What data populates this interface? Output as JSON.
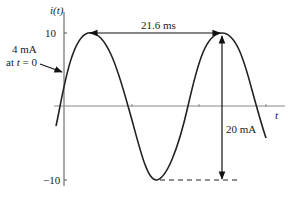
{
  "diagram": {
    "type": "sinusoid-waveform",
    "y_axis_label": "i(t)",
    "x_axis_label": "t",
    "y_ticks": [
      {
        "label": "10",
        "value": 10
      },
      {
        "label": "−10",
        "value": -10
      }
    ],
    "annotations": {
      "initial_value": {
        "line1": "4 mA",
        "line2_prefix": "at ",
        "line2_var": "t",
        "line2_suffix": " = 0"
      },
      "period": {
        "label": "21.6 ms"
      },
      "peak_to_peak": {
        "label": "20 mA"
      }
    },
    "waveform": {
      "amplitude_mA": 10,
      "period_ms": 21.6,
      "initial_value_mA": 4,
      "peak_to_peak_mA": 20
    },
    "colors": {
      "line": "#222222",
      "axis": "#555555",
      "background": "#ffffff"
    }
  }
}
